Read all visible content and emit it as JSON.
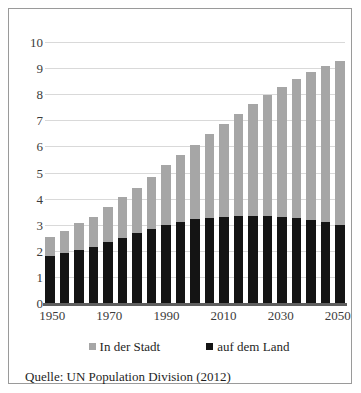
{
  "chart_data": {
    "type": "bar",
    "stacked": true,
    "title": "",
    "subtitle": "",
    "xlabel": "",
    "ylabel": "",
    "ylim": [
      0,
      10
    ],
    "y_ticks": [
      0,
      1,
      2,
      3,
      4,
      5,
      6,
      7,
      8,
      9,
      10
    ],
    "grid": true,
    "legend_position": "bottom",
    "categories": [
      "1950",
      "1955",
      "1960",
      "1965",
      "1970",
      "1975",
      "1980",
      "1985",
      "1990",
      "1995",
      "2000",
      "2005",
      "2010",
      "2015",
      "2020",
      "2025",
      "2030",
      "2035",
      "2040",
      "2045",
      "2050"
    ],
    "x_tick_labels": [
      "1950",
      "1970",
      "1990",
      "2010",
      "2030",
      "2050"
    ],
    "series": [
      {
        "name": "auf dem Land",
        "color": "#141414",
        "values": [
          1.79,
          1.9,
          2.03,
          2.15,
          2.33,
          2.51,
          2.67,
          2.84,
          2.99,
          3.12,
          3.22,
          3.27,
          3.3,
          3.32,
          3.32,
          3.32,
          3.29,
          3.25,
          3.19,
          3.1,
          3.0
        ]
      },
      {
        "name": "In der Stadt",
        "color": "#a6a6a6",
        "values": [
          0.75,
          0.87,
          1.02,
          1.16,
          1.35,
          1.55,
          1.75,
          1.99,
          2.28,
          2.56,
          2.85,
          3.2,
          3.55,
          3.92,
          4.3,
          4.65,
          5.0,
          5.34,
          5.65,
          5.97,
          6.26
        ]
      }
    ],
    "totals": [
      2.54,
      2.77,
      3.05,
      3.31,
      3.68,
      4.06,
      4.42,
      4.83,
      5.27,
      5.68,
      6.07,
      6.47,
      6.85,
      7.24,
      7.62,
      7.97,
      8.29,
      8.59,
      8.84,
      9.07,
      9.26
    ]
  },
  "legend": {
    "items": [
      {
        "label": "In der Stadt",
        "color": "#a6a6a6"
      },
      {
        "label": "auf dem Land",
        "color": "#141414"
      }
    ]
  },
  "source": {
    "text": "Quelle: UN Population Division (2012)"
  },
  "colors": {
    "urban": "#a6a6a6",
    "rural": "#141414",
    "gridline": "#d9d9d9",
    "axis": "#5f5f5f",
    "frame": "#9a9a9a",
    "text": "#1f1f1f",
    "tick_text": "#3b3b3b",
    "background": "#ffffff"
  }
}
